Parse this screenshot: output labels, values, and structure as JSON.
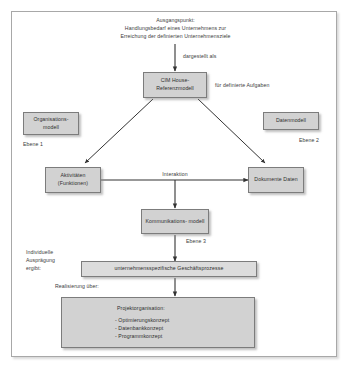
{
  "diagram": {
    "frame": {
      "border_color": "#a8a8a8",
      "background": "#ffffff"
    },
    "colors": {
      "box_fill": "#d2d2d2",
      "box_fill_light": "#dcdcdc",
      "box_border": "#7c7c7c",
      "text": "#3c3c3c",
      "connector": "#333333"
    },
    "nodes": {
      "start_text": "Ausgangspunkt:\nHandlungsbedarf eines Unternehmens zur\nErreichung der definierten Unternehmensziele",
      "dargestellt_als": "dargestellt als",
      "cim_house": "CIM House-\nReferenzmodell",
      "fuer_definierte_aufgaben": "für definierte Aufgaben",
      "organisationsmodell": "Organisations-\nmodell",
      "ebene_1": "Ebene 1",
      "datenmodell": "Datenmodell",
      "ebene_2": "Ebene 2",
      "aktivitaeten": "Aktivitäten\n(Funktionen)",
      "interaktion": "Interaktion",
      "dokumente": "Dokumente\nDaten",
      "kommunikationsmodell": "Kommunikations-\nmodell",
      "ebene_3": "Ebene 3",
      "individuelle_auspraegung": "Individuelle\nAusprägung\nergibt:",
      "geschaeftsprozesse": "unternehmensspezifische  Geschäftsprozesse",
      "realisierung_ueber": "Realisierung über:",
      "projektorganisation_title": "Projektorganisation:",
      "projektorganisation_items": [
        "-  Optimierungskonzept",
        "-  Datenbankkonzept",
        "-  Programmkonzept"
      ]
    }
  }
}
